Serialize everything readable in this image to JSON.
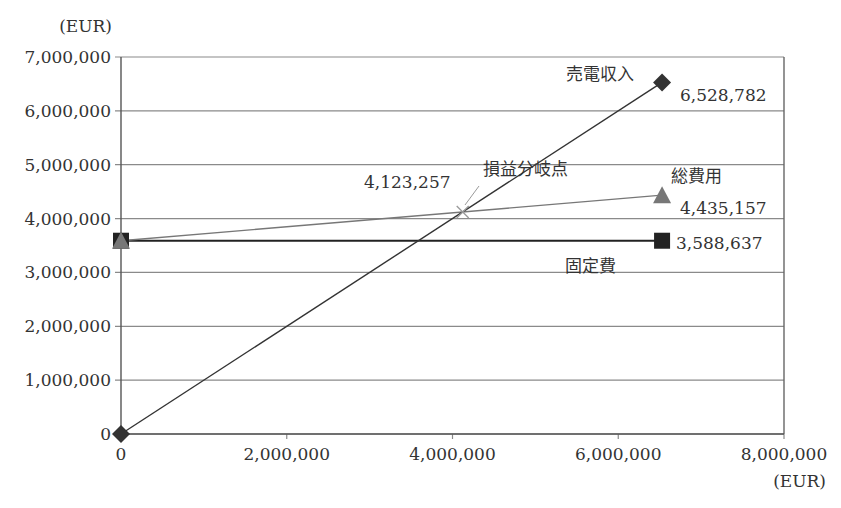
{
  "chart_data": {
    "type": "line",
    "title": "",
    "xlabel": "(EUR)",
    "ylabel": "(EUR)",
    "xlim": [
      0,
      8000000
    ],
    "ylim": [
      0,
      7000000
    ],
    "x_ticks": [
      "0",
      "2,000,000",
      "4,000,000",
      "6,000,000",
      "8,000,000"
    ],
    "y_ticks": [
      "0",
      "1,000,000",
      "2,000,000",
      "3,000,000",
      "4,000,000",
      "5,000,000",
      "6,000,000",
      "7,000,000"
    ],
    "grid": "horizontal",
    "legend": "none (inline labels)",
    "series": [
      {
        "name": "売電収入",
        "marker": "diamond",
        "color": "#333333",
        "points": [
          [
            0,
            0
          ],
          [
            6528782,
            6528782
          ]
        ],
        "end_label": "6,528,782"
      },
      {
        "name": "総費用",
        "marker": "triangle",
        "color": "#777777",
        "points": [
          [
            0,
            3588637
          ],
          [
            6528782,
            4435157
          ]
        ],
        "end_label": "4,435,157"
      },
      {
        "name": "固定費",
        "marker": "square",
        "color": "#222222",
        "points": [
          [
            0,
            3588637
          ],
          [
            6528782,
            3588637
          ]
        ],
        "end_label": "3,588,637"
      }
    ],
    "annotations": [
      {
        "name": "損益分岐点",
        "marker": "cross",
        "x": 4123257,
        "y": 4123257,
        "value_label": "4,123,257"
      }
    ]
  },
  "axes": {
    "y_unit": "(EUR)",
    "x_unit": "(EUR)"
  },
  "labels": {
    "revenue_name": "売電収入",
    "revenue_value": "6,528,782",
    "total_cost_name": "総費用",
    "total_cost_value": "4,435,157",
    "fixed_cost_name": "固定費",
    "fixed_cost_value": "3,588,637",
    "breakeven_name": "損益分岐点",
    "breakeven_value": "4,123,257"
  },
  "colors": {
    "revenue": "#333333",
    "total_cost": "#777777",
    "fixed_cost": "#222222",
    "grid": "#8a8a8a",
    "breakeven": "#9a9a9a"
  }
}
